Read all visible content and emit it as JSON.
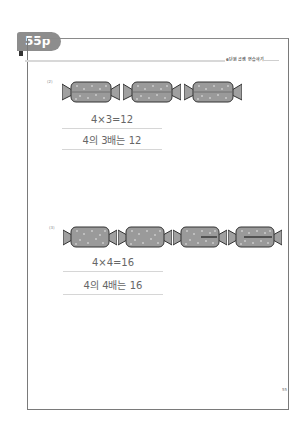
{
  "page_tab": {
    "label": "55p"
  },
  "header": {
    "section_text": "6단원 곱셈 연습하기"
  },
  "problems": [
    {
      "number": "(2)",
      "candy_count": 3,
      "equation": "4×3=12",
      "sentence": "4의 3배는 12"
    },
    {
      "number": "(3)",
      "candy_count": 4,
      "equation": "4×4=16",
      "sentence": "4의 4배는 16"
    }
  ],
  "footer": {
    "page_number": "55"
  },
  "colors": {
    "tab": "#8d8d8d",
    "candy_fill": "#9a9a9a",
    "frame": "#7a7a7a"
  }
}
